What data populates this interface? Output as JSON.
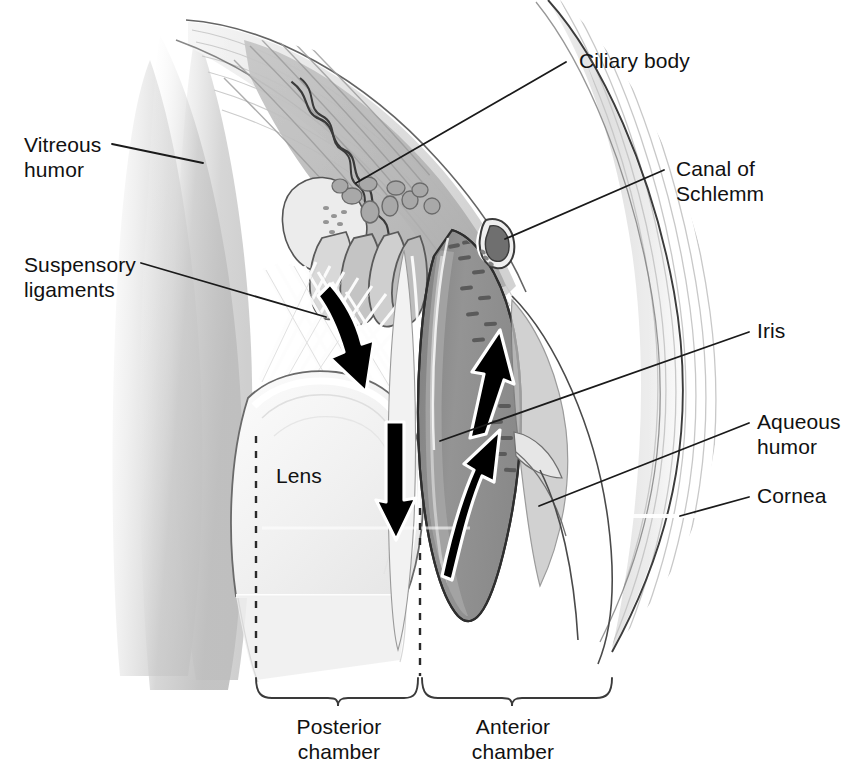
{
  "figure": {
    "type": "anatomical-diagram"
  },
  "labels": {
    "vitreous_humor": "Vitreous\nhumor",
    "suspensory_ligaments": "Suspensory\nligaments",
    "ciliary_body": "Ciliary body",
    "canal_of_schlemm": "Canal of\nSchlemm",
    "iris": "Iris",
    "aqueous_humor": "Aqueous\nhumor",
    "cornea": "Cornea",
    "lens": "Lens",
    "posterior_chamber": "Posterior\nchamber",
    "anterior_chamber": "Anterior\nchamber"
  },
  "colors": {
    "text": "#111111",
    "line": "#1a1a1a",
    "iris_fill": "#8f8f8f",
    "iris_inner": "#9d9d9d",
    "sclera_light": "#e9e9e9",
    "sclera_mid": "#d4d4d4",
    "vitreous": "#d8d8d8",
    "lens": "#f2f2f2",
    "ciliary_muscle": "#b8b8b8",
    "arrow": "#000000",
    "background": "#ffffff"
  },
  "flow_arrows": [
    {
      "name": "posterior-chamber-down-arrow-upper",
      "direction": "down",
      "region": "posterior chamber near ciliary processes"
    },
    {
      "name": "posterior-chamber-down-arrow-lower",
      "direction": "down",
      "region": "posterior chamber behind iris"
    },
    {
      "name": "anterior-chamber-up-arrow-upper",
      "direction": "up",
      "region": "anterior chamber toward canal of Schlemm"
    },
    {
      "name": "anterior-chamber-up-arrow-lower",
      "direction": "up-curved",
      "region": "pupil into anterior chamber"
    }
  ]
}
